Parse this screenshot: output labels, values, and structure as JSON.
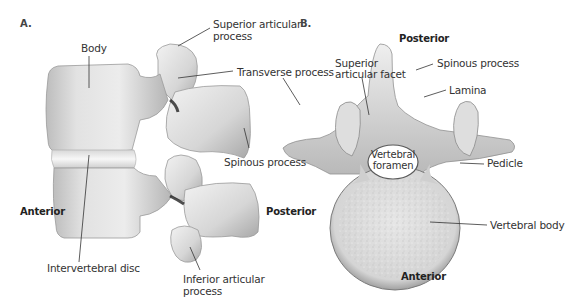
{
  "figure": {
    "panels": [
      {
        "id": "A",
        "letter": "A.",
        "view": "Lateral view of two stacked lumbar vertebrae",
        "orientation": {
          "left": "Anterior",
          "right": "Posterior"
        },
        "labels": {
          "body": "Body",
          "superior_articular_process_1": "Superior articular",
          "superior_articular_process_2": "process",
          "transverse_process": "Transverse process",
          "spinous_process": "Spinous process",
          "intervertebral_disc": "Intervertebral disc",
          "inferior_articular_process_1": "Inferior articular",
          "inferior_articular_process_2": "process"
        }
      },
      {
        "id": "B",
        "letter": "B.",
        "view": "Superior view of a lumbar vertebra",
        "orientation": {
          "top": "Posterior",
          "bottom": "Anterior"
        },
        "labels": {
          "superior_articular_facet_1": "Superior",
          "superior_articular_facet_2": "articular facet",
          "spinous_process": "Spinous process",
          "lamina": "Lamina",
          "vertebral_foramen_1": "Vertebral",
          "vertebral_foramen_2": "foramen",
          "pedicle": "Pedicle",
          "vertebral_body": "Vertebral body"
        }
      }
    ],
    "colors": {
      "bone_light": "#e9e9e9",
      "bone_mid": "#c8c8c8",
      "bone_dark": "#8a8a8a",
      "leader_line": "#333333",
      "text": "#333333"
    }
  }
}
